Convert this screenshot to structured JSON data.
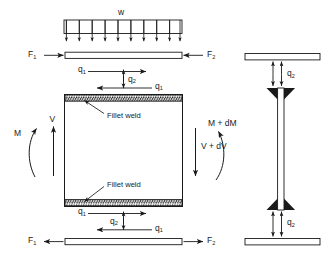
{
  "figure": {
    "type": "engineering-free-body-diagram",
    "ink_color": "#1a1a1a",
    "fill_color": "#ffffff",
    "background": "#ffffff"
  },
  "left_view": {
    "name": "side-elevation-free-body",
    "distributed_load": {
      "label": "w",
      "arrow_count": 10,
      "direction": "down"
    },
    "top_flange": {
      "left_force_label": "F",
      "left_force_sub": "1",
      "left_force_direction": "right-inward",
      "right_force_label": "F",
      "right_force_sub": "2",
      "right_force_direction": "left-inward"
    },
    "top_shear_flow": {
      "upper_label": "q",
      "upper_sub": "1",
      "upper_direction": "right",
      "vertical_label": "q",
      "vertical_sub": "2",
      "vertical_direction": "up-down",
      "lower_label": "q",
      "lower_sub": "1",
      "lower_direction": "left"
    },
    "web_block": {
      "top_weld_label": "Fillet weld",
      "bottom_weld_label": "Fillet weld",
      "left_moment_label": "M",
      "left_shear_label": "V",
      "left_shear_direction": "up",
      "right_moment_label": "M + dM",
      "right_shear_label": "V + dV",
      "right_shear_direction": "down"
    },
    "bottom_shear_flow": {
      "upper_label": "q",
      "upper_sub": "1",
      "upper_direction": "right",
      "vertical_label": "q",
      "vertical_sub": "2",
      "vertical_direction": "up-down",
      "lower_label": "q",
      "lower_sub": "1",
      "lower_direction": "left"
    },
    "bottom_flange": {
      "left_force_label": "F",
      "left_force_sub": "1",
      "left_force_direction": "left-outward",
      "right_force_label": "F",
      "right_force_sub": "2",
      "right_force_direction": "right-outward"
    }
  },
  "right_view": {
    "name": "cross-section-view",
    "top_flange_flow_label": "q",
    "top_flange_flow_sub": "2",
    "bottom_flange_flow_label": "q",
    "bottom_flange_flow_sub": "2",
    "weld_shape": "fillet-weld-triangles",
    "arrow_pairs_per_location": 2
  }
}
